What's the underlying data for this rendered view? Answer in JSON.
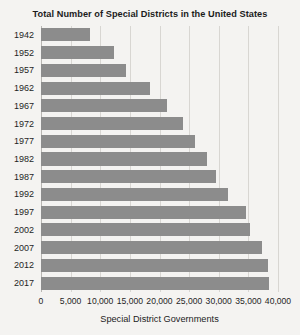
{
  "chart_data": {
    "type": "bar",
    "orientation": "horizontal",
    "title": "Total Number of Special Districts in the United States",
    "xlabel": "Special District Governments",
    "ylabel": "",
    "xlim": [
      0,
      40000
    ],
    "xticks": [
      0,
      5000,
      10000,
      15000,
      20000,
      25000,
      30000,
      35000,
      40000
    ],
    "xtick_labels": [
      "0",
      "5,000",
      "10,000",
      "15,000",
      "20,000",
      "25,000",
      "30,000",
      "35,000",
      "40,000"
    ],
    "grid": true,
    "legend": false,
    "categories": [
      "1942",
      "1952",
      "1957",
      "1962",
      "1967",
      "1972",
      "1977",
      "1982",
      "1987",
      "1992",
      "1997",
      "2002",
      "2007",
      "2012",
      "2017"
    ],
    "values": [
      8299,
      12340,
      14424,
      18323,
      21264,
      23885,
      25962,
      28078,
      29532,
      31555,
      34683,
      35356,
      37381,
      38266,
      38542
    ],
    "bar_color": "#8c8c8c",
    "background_color": "#f4f3f1",
    "gridline_color": "#d8d6d2",
    "text_color": "#1f1f1f"
  }
}
